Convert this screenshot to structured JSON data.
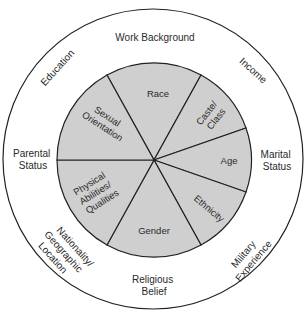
{
  "diagram": {
    "type": "concentric-wheel",
    "colors": {
      "inner_fill": "#cfcfcf",
      "outer_fill": "#ffffff",
      "stroke": "#222222",
      "text": "#2a2a2a"
    },
    "inner_dimensions": {
      "race": "Race",
      "caste_class": [
        "Caste/",
        "Class"
      ],
      "age": "Age",
      "ethnicity": "Ethnicity",
      "gender": "Gender",
      "physical": [
        "Physical",
        "Abilities/",
        "Qualities"
      ],
      "sexual_orientation": [
        "Sexual",
        "Orientation"
      ]
    },
    "outer_dimensions": {
      "work_background": "Work Background",
      "income": "Income",
      "marital_status": [
        "Marital",
        "Status"
      ],
      "military_experience": [
        "Military",
        "Experience"
      ],
      "religious_belief": [
        "Religious",
        "Belief"
      ],
      "nationality": [
        "Nationality/",
        "Geographic",
        "Location"
      ],
      "parental_status": [
        "Parental",
        "Status"
      ],
      "education": "Education"
    }
  }
}
